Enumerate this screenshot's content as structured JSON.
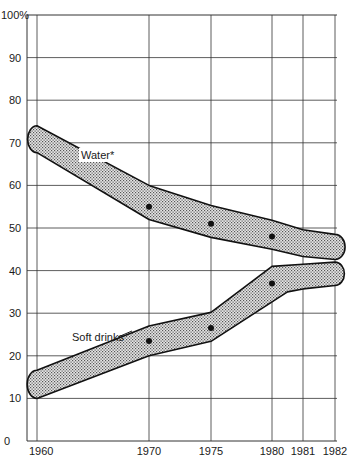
{
  "chart_data": {
    "type": "area",
    "title": "",
    "xlabel": "",
    "ylabel": "",
    "ylim": [
      0,
      100
    ],
    "y_ticks": [
      "0",
      "10",
      "20",
      "30",
      "40",
      "50",
      "60",
      "70",
      "80",
      "90",
      "100%"
    ],
    "x_ticks": [
      "1960",
      "1970",
      "1975",
      "1980",
      "1981",
      "1982"
    ],
    "grid": true,
    "series": [
      {
        "name": "Water*",
        "style": "shaded band with point estimates",
        "points": [
          {
            "x": 1970,
            "y": 55
          },
          {
            "x": 1975,
            "y": 51
          },
          {
            "x": 1980,
            "y": 48
          }
        ],
        "band_upper": [
          {
            "x": 1960,
            "y": 74
          },
          {
            "x": 1970,
            "y": 60
          },
          {
            "x": 1975,
            "y": 55.3
          },
          {
            "x": 1980,
            "y": 51.8
          },
          {
            "x": 1981,
            "y": 49.6
          },
          {
            "x": 1982,
            "y": 48.5
          }
        ],
        "band_lower": [
          {
            "x": 1960,
            "y": 67.7
          },
          {
            "x": 1970,
            "y": 52
          },
          {
            "x": 1975,
            "y": 47.8
          },
          {
            "x": 1980,
            "y": 45
          },
          {
            "x": 1981,
            "y": 43.3
          },
          {
            "x": 1982,
            "y": 42.6
          }
        ]
      },
      {
        "name": "Soft drinks",
        "style": "shaded band with point estimates",
        "points": [
          {
            "x": 1970,
            "y": 23.5
          },
          {
            "x": 1975,
            "y": 26.5
          },
          {
            "x": 1980,
            "y": 37
          }
        ],
        "band_upper": [
          {
            "x": 1960,
            "y": 16.6
          },
          {
            "x": 1970,
            "y": 27
          },
          {
            "x": 1975,
            "y": 30.2
          },
          {
            "x": 1980,
            "y": 41
          },
          {
            "x": 1981,
            "y": 41.5
          },
          {
            "x": 1982,
            "y": 42
          }
        ],
        "band_lower": [
          {
            "x": 1960,
            "y": 10
          },
          {
            "x": 1970,
            "y": 20
          },
          {
            "x": 1975,
            "y": 23.4
          },
          {
            "x": 1980.5,
            "y": 35
          },
          {
            "x": 1981,
            "y": 35.7
          },
          {
            "x": 1982,
            "y": 36.5
          }
        ]
      }
    ],
    "annotations": [
      "Water*",
      "Soft drinks"
    ],
    "legend": "none (inline labels)"
  },
  "labels": {
    "water": "Water*",
    "soft_drinks": "Soft drinks"
  }
}
